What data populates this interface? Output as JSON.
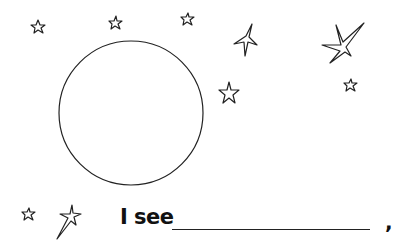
{
  "worksheet": {
    "prompt_text": "I see",
    "blank_line": "",
    "punctuation": ",",
    "moon": {
      "shape": "circle",
      "cx": 131,
      "cy": 113,
      "r": 72
    },
    "stars": [
      {
        "name": "star-small-top-left",
        "cx": 38,
        "cy": 27,
        "r": 6
      },
      {
        "name": "star-small-top-center",
        "cx": 115,
        "cy": 23,
        "r": 6
      },
      {
        "name": "star-small-top-right",
        "cx": 187,
        "cy": 19,
        "r": 6
      },
      {
        "name": "star-four-point-top",
        "cx": 244,
        "cy": 40,
        "r": 14
      },
      {
        "name": "star-shooting-large",
        "cx": 340,
        "cy": 42,
        "r": 18
      },
      {
        "name": "star-medium-right-of-moon",
        "cx": 229,
        "cy": 93,
        "r": 10
      },
      {
        "name": "star-small-right",
        "cx": 350,
        "cy": 85,
        "r": 6
      },
      {
        "name": "star-small-bottom-left",
        "cx": 28,
        "cy": 214,
        "r": 6
      },
      {
        "name": "star-shooting-bottom",
        "cx": 72,
        "cy": 216,
        "r": 12
      }
    ],
    "stroke_color": "#222222",
    "background_color": "#ffffff"
  }
}
